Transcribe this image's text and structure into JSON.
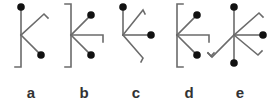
{
  "figure": {
    "line_color": "#6b6b6b",
    "dot_color": "#111111",
    "panels": [
      {
        "label": "a",
        "label_x": 31
      },
      {
        "label": "b",
        "label_x": 84
      },
      {
        "label": "c",
        "label_x": 136
      },
      {
        "label": "d",
        "label_x": 189
      },
      {
        "label": "e",
        "label_x": 240
      }
    ]
  }
}
